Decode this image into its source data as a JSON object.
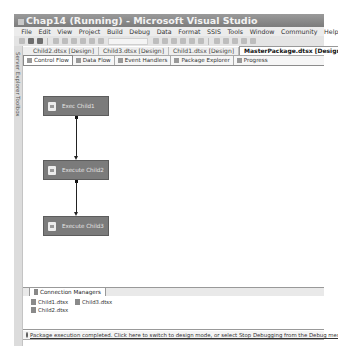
{
  "window": {
    "title": "Chap14 (Running) - Microsoft Visual Studio"
  },
  "menu": {
    "items": [
      "File",
      "Edit",
      "View",
      "Project",
      "Build",
      "Debug",
      "Data",
      "Format",
      "SSIS",
      "Tools",
      "Window",
      "Community",
      "Help"
    ]
  },
  "side_strip": {
    "items": [
      "Server Explorer",
      "Toolbox"
    ]
  },
  "document_tabs": [
    {
      "label": "Child2.dtsx [Design]",
      "active": false
    },
    {
      "label": "Child3.dtsx [Design]",
      "active": false
    },
    {
      "label": "Child1.dtsx [Design]",
      "active": false
    },
    {
      "label": "MasterPackage.dtsx [Design]",
      "active": true
    }
  ],
  "designer_tabs": [
    {
      "label": "Control Flow",
      "icon": "control-flow-icon",
      "active": true
    },
    {
      "label": "Data Flow",
      "icon": "data-flow-icon",
      "active": false
    },
    {
      "label": "Event Handlers",
      "icon": "event-handlers-icon",
      "active": false
    },
    {
      "label": "Package Explorer",
      "icon": "package-explorer-icon",
      "active": false
    },
    {
      "label": "Progress",
      "icon": "progress-icon",
      "active": false
    }
  ],
  "canvas": {
    "tasks": [
      {
        "label": "Exec Child1",
        "icon": "execute-package-task-icon"
      },
      {
        "label": "Execute Child2",
        "icon": "execute-package-task-icon"
      },
      {
        "label": "Execute Child3",
        "icon": "execute-package-task-icon"
      }
    ],
    "task_color": "#7b7b7b"
  },
  "connection_managers": {
    "tab_label": "Connection Managers",
    "items": [
      "Child1.dtsx",
      "Child3.dtsx",
      "Child2.dtsx"
    ]
  },
  "status": {
    "message": "Package execution completed. Click here to switch to design mode, or select Stop Debugging from the Debug menu."
  }
}
